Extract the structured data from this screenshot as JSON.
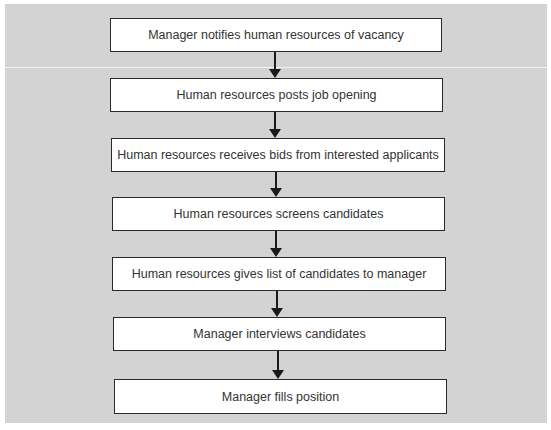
{
  "diagram": {
    "type": "flowchart",
    "direction": "top-to-bottom",
    "background_color": "#d3d3d3",
    "box_color": "#ffffff",
    "border_color": "#2a2a2a",
    "steps": [
      {
        "label": "Manager notifies human resources of vacancy"
      },
      {
        "label": "Human resources posts job opening"
      },
      {
        "label": "Human resources receives bids from interested applicants"
      },
      {
        "label": "Human resources screens candidates"
      },
      {
        "label": "Human resources gives list of candidates to manager"
      },
      {
        "label": "Manager interviews candidates"
      },
      {
        "label": "Manager fills position"
      }
    ],
    "connectors": [
      {
        "from": 0,
        "to": 1
      },
      {
        "from": 1,
        "to": 2
      },
      {
        "from": 2,
        "to": 3
      },
      {
        "from": 3,
        "to": 4
      },
      {
        "from": 4,
        "to": 5
      },
      {
        "from": 5,
        "to": 6
      }
    ]
  }
}
